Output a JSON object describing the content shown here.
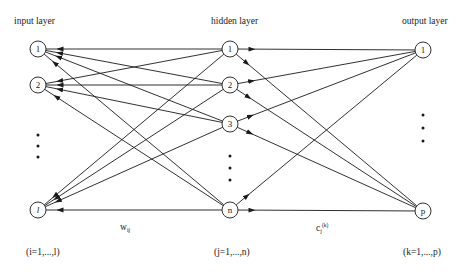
{
  "diagram": {
    "layers": [
      {
        "id": "input",
        "label": "input layer",
        "index_label": "(i=1,...,l)",
        "x": 38,
        "nodes": [
          {
            "id": "i1",
            "label": "1",
            "y": 49
          },
          {
            "id": "i2",
            "label": "2",
            "y": 85
          },
          {
            "id": "il",
            "label": "l",
            "y": 210,
            "italic": true
          }
        ],
        "ellipsis_y": [
          135,
          146,
          157
        ]
      },
      {
        "id": "hidden",
        "label": "hidden layer",
        "index_label": "(j=1,...,n)",
        "x": 230,
        "nodes": [
          {
            "id": "h1",
            "label": "1",
            "y": 49
          },
          {
            "id": "h2",
            "label": "2",
            "y": 85
          },
          {
            "id": "h3",
            "label": "3",
            "y": 124
          },
          {
            "id": "hn",
            "label": "n",
            "y": 210
          }
        ],
        "ellipsis_y": [
          156,
          168,
          180
        ]
      },
      {
        "id": "output",
        "label": "output layer",
        "index_label": "(k=1,...,p)",
        "x": 423,
        "nodes": [
          {
            "id": "o1",
            "label": "1",
            "y": 50
          },
          {
            "id": "op",
            "label": "p",
            "y": 211
          }
        ],
        "ellipsis_y": [
          115,
          128,
          141
        ]
      }
    ],
    "weights": {
      "input_hidden": {
        "base": "w",
        "subscript": "ij"
      },
      "hidden_output": {
        "base": "c",
        "subscript": "j",
        "superscript": "(k)"
      }
    },
    "connections": "fully connected input→hidden and hidden→output",
    "colors": {
      "stroke": "#1a1a1a",
      "background": "#ffffff"
    }
  }
}
